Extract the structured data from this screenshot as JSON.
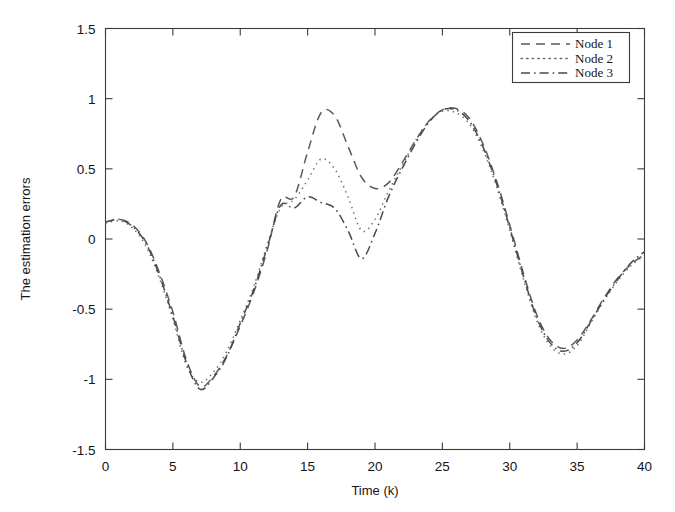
{
  "chart_data": {
    "type": "line",
    "title": "",
    "xlabel": "Time (k)",
    "ylabel": "The estimation errors",
    "xlim": [
      0,
      40
    ],
    "ylim": [
      -1.5,
      1.5
    ],
    "xticks": [
      0,
      5,
      10,
      15,
      20,
      25,
      30,
      35,
      40
    ],
    "xtick_labels": [
      "0",
      "5",
      "10",
      "15",
      "20",
      "25",
      "30",
      "35",
      "40"
    ],
    "yticks": [
      -1.5,
      -1,
      -0.5,
      0,
      0.5,
      1,
      1.5
    ],
    "ytick_labels": [
      "-1.5",
      "-1",
      "-0.5",
      "0",
      "0.5",
      "1",
      "1.5"
    ],
    "grid": false,
    "legend_position": "upper right",
    "x": [
      0,
      1,
      2,
      3,
      4,
      5,
      6,
      7,
      8,
      9,
      10,
      11,
      12,
      13,
      14,
      15,
      16,
      17,
      18,
      19,
      20,
      21,
      22,
      23,
      24,
      25,
      26,
      27,
      28,
      29,
      30,
      31,
      32,
      33,
      34,
      35,
      36,
      37,
      38,
      39,
      40
    ],
    "series": [
      {
        "name": "Node 1",
        "style": "dashed",
        "color": "#5a5a5a",
        "values": [
          0.12,
          0.14,
          0.1,
          -0.02,
          -0.24,
          -0.52,
          -0.86,
          -1.05,
          -0.98,
          -0.83,
          -0.62,
          -0.38,
          -0.08,
          0.28,
          0.3,
          0.62,
          0.9,
          0.88,
          0.66,
          0.44,
          0.36,
          0.4,
          0.54,
          0.7,
          0.84,
          0.92,
          0.93,
          0.86,
          0.68,
          0.42,
          0.1,
          -0.24,
          -0.54,
          -0.72,
          -0.78,
          -0.72,
          -0.58,
          -0.42,
          -0.28,
          -0.18,
          -0.11
        ]
      },
      {
        "name": "Node 2",
        "style": "dotted",
        "color": "#6a6a6a",
        "values": [
          0.11,
          0.13,
          0.08,
          -0.05,
          -0.28,
          -0.57,
          -0.9,
          -1.02,
          -0.95,
          -0.8,
          -0.58,
          -0.34,
          -0.04,
          0.22,
          0.28,
          0.42,
          0.57,
          0.5,
          0.3,
          0.06,
          0.14,
          0.34,
          0.52,
          0.7,
          0.84,
          0.91,
          0.9,
          0.82,
          0.64,
          0.38,
          0.06,
          -0.28,
          -0.58,
          -0.76,
          -0.82,
          -0.76,
          -0.6,
          -0.44,
          -0.3,
          -0.19,
          -0.12
        ]
      },
      {
        "name": "Node 3",
        "style": "dashdot",
        "color": "#4a4a4a",
        "values": [
          0.12,
          0.14,
          0.09,
          -0.03,
          -0.26,
          -0.55,
          -0.88,
          -1.07,
          -0.99,
          -0.84,
          -0.6,
          -0.36,
          -0.06,
          0.24,
          0.22,
          0.3,
          0.26,
          0.22,
          0.06,
          -0.14,
          0.04,
          0.3,
          0.5,
          0.68,
          0.83,
          0.92,
          0.92,
          0.84,
          0.66,
          0.4,
          0.08,
          -0.26,
          -0.56,
          -0.74,
          -0.8,
          -0.74,
          -0.59,
          -0.43,
          -0.29,
          -0.17,
          -0.09
        ]
      }
    ]
  },
  "legend": {
    "entries": [
      {
        "label": "Node 1"
      },
      {
        "label": "Node 2"
      },
      {
        "label": "Node 3"
      }
    ]
  }
}
